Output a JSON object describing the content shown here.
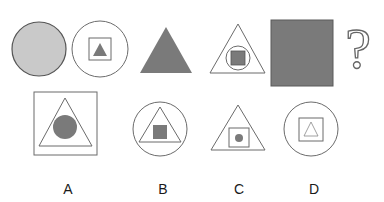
{
  "puzzle": {
    "question_mark": "?",
    "colors": {
      "background": "#ffffff",
      "outline": "#6b6b6b",
      "light_fill": "#c9c9c9",
      "dark_fill": "#7a7a7a"
    },
    "sequence": [
      {
        "position": 1,
        "description": "light gray filled circle"
      },
      {
        "position": 2,
        "description": "circle containing square containing dark triangle"
      },
      {
        "position": 3,
        "description": "dark filled triangle"
      },
      {
        "position": 4,
        "description": "triangle containing circle containing dark square"
      },
      {
        "position": 5,
        "description": "dark filled square"
      },
      {
        "position": 6,
        "description": "question mark"
      }
    ],
    "options": [
      {
        "label": "A",
        "description": "square containing triangle containing dark circle"
      },
      {
        "label": "B",
        "description": "circle containing triangle containing dark square"
      },
      {
        "label": "C",
        "description": "triangle containing square containing dark dot"
      },
      {
        "label": "D",
        "description": "circle containing square containing outlined triangle"
      }
    ]
  }
}
